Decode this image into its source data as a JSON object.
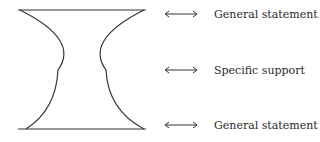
{
  "diagram": {
    "shape": "hourglass",
    "stroke_color": "#333333",
    "rows": [
      {
        "label": "General statement",
        "arrow": "double-arrow-icon"
      },
      {
        "label": "Specific support",
        "arrow": "double-arrow-icon"
      },
      {
        "label": "General statement",
        "arrow": "double-arrow-icon"
      }
    ]
  }
}
